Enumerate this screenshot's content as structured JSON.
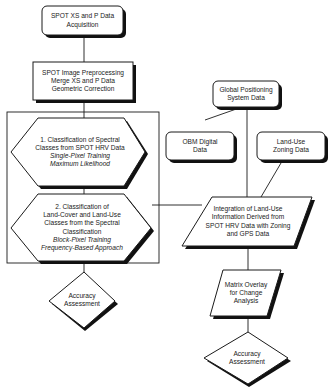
{
  "nodes": {
    "acquisition": {
      "lines": [
        "SPOT XS and P Data",
        "Acquisition"
      ]
    },
    "preprocessing": {
      "lines": [
        "SPOT Image Preprocessing",
        "Merge XS and P Data",
        "Geometric Correction"
      ]
    },
    "classification1": {
      "lines": [
        "1.  Classification of Spectral",
        "Classes from SPOT HRV Data"
      ],
      "italic_lines": [
        "Single-Pixel  Training",
        "Maximum  Likelihood"
      ]
    },
    "classification2": {
      "lines": [
        "2. Classification of",
        "Land-Cover and Land-Use",
        "Classes from the Spectral",
        "Classification"
      ],
      "italic_lines": [
        "Block-Pixel  Training",
        "Frequency-Based Approach"
      ]
    },
    "accuracy_left": {
      "lines": [
        "Accuracy",
        "Assessment"
      ]
    },
    "gps": {
      "lines": [
        "Global Positioning",
        "System Data"
      ]
    },
    "obm": {
      "lines": [
        "OBM Digital",
        "Data"
      ]
    },
    "zoning": {
      "lines": [
        "Land-Use",
        "Zoning Data"
      ]
    },
    "integration": {
      "lines": [
        "Integration of Land-Use",
        "Information Derived from",
        "SPOT HRV Data with Zoning",
        "and GPS Data"
      ]
    },
    "matrix": {
      "lines": [
        "Matrix Overlay",
        "for Change",
        "Analysis"
      ]
    },
    "accuracy_right": {
      "lines": [
        "Accuracy",
        "Assessment"
      ]
    }
  },
  "colors": {
    "stroke": "#1a1a1a",
    "shadow": "#111111",
    "fill": "#ffffff"
  }
}
